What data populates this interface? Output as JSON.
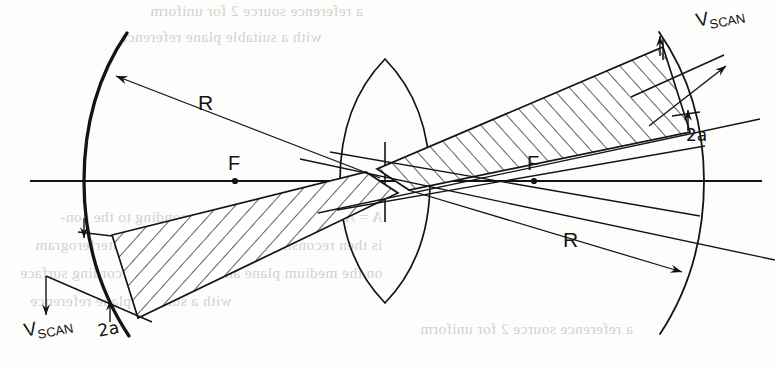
{
  "figure": {
    "type": "optical-diagram",
    "background_color": "#fdfdfc",
    "ink_color": "#141414"
  },
  "labels": {
    "radius_left": "R",
    "radius_right": "R",
    "focus_left": "F",
    "focus_right": "F",
    "aperture_top": "2a",
    "aperture_bottom": "2a",
    "scan_velocity_symbol": "V",
    "scan_velocity_subscript": "SCAN"
  },
  "elements": {
    "optical_axis": {
      "name": "optical-axis",
      "y": 181,
      "x_start": 30,
      "x_end": 760
    },
    "lens": {
      "name": "biconvex-lens",
      "center_x": 385,
      "center_y": 181,
      "half_height": 122,
      "half_width": 28
    },
    "mirror_left": {
      "name": "concave-mirror-left",
      "vertex_x": 84,
      "vertex_y": 181,
      "stroke_width": 3.2
    },
    "mirror_right": {
      "name": "concave-mirror-right",
      "vertex_x": 704,
      "vertex_y": 181,
      "stroke_width": 1.7
    },
    "focus_left_point": {
      "x": 235,
      "y": 181
    },
    "focus_right_point": {
      "x": 534,
      "y": 181
    },
    "beam_hatch_angle_deg": 45,
    "beam_hatch_spacing": 13
  },
  "bleed_through_text": [
    "a reference source   2 for uniform",
    "with a suitable plane  reference",
    "A = A. The objective 1 corresponding to the con-",
    "is then reconstructed by projecting the interferogram",
    "on the medium plane  and then on the recording  surface"
  ]
}
